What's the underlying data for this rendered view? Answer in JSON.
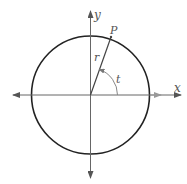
{
  "diagram": {
    "type": "unit-circle",
    "labels": {
      "x_axis": "x",
      "y_axis": "y",
      "point": "P",
      "radius": "r",
      "angle": "t"
    },
    "geometry": {
      "center": [
        90.5,
        95
      ],
      "radius": 59,
      "point_P": [
        111,
        37
      ],
      "angle_arc_radius": 27
    },
    "colors": {
      "circle": "#222222",
      "axes": "#555555",
      "radius_line": "#444444",
      "angle_arc": "#888888",
      "labels": "#555555"
    }
  }
}
